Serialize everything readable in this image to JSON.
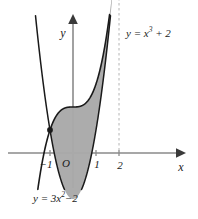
{
  "figure": {
    "background_color": "#ffffff",
    "shade_color": "#a9a9a9",
    "curve_color": "#1a1a1a",
    "axis_color": "#808080",
    "dash_color": "#b4b4b4"
  },
  "axes": {
    "x_label": "x",
    "y_label": "y",
    "origin_label": "O",
    "x_ticks": [
      {
        "label": "−1",
        "value": -1
      },
      {
        "label": "1",
        "value": 1
      },
      {
        "label": "2",
        "value": 2
      }
    ],
    "x_range": [
      -2.85,
      4.75
    ],
    "y_range": [
      -2.6,
      6.0
    ],
    "origin_px": {
      "x": 73,
      "y": 153
    },
    "unit_px": 23,
    "grid": "off"
  },
  "curves": {
    "cubic": {
      "label_prefix": "y = x",
      "label_exponent": "3",
      "label_suffix": "+ 2",
      "equation_plain": "y = x³ + 2",
      "expression": "x^3 + 2",
      "y_intercept": 2
    },
    "parabola": {
      "label_prefix": "y = 3x",
      "label_exponent": "2",
      "label_suffix": "−2",
      "equation_plain": "y = 3x² − 2",
      "expression": "3x^2 - 2",
      "vertex": {
        "x": 0,
        "y": -2
      }
    }
  },
  "intersections": [
    {
      "x": -1,
      "y": 1,
      "px": {
        "x": 50,
        "y": 130
      }
    },
    {
      "x": 2,
      "y": 10,
      "px": {
        "x": 119,
        "y": 33
      }
    }
  ],
  "dashed_guide": {
    "at_x": 2,
    "from_y": 10,
    "to_y": 0
  },
  "chart_data": {
    "type": "line",
    "title": "",
    "xlabel": "x",
    "ylabel": "y",
    "xlim": [
      -2.85,
      4.75
    ],
    "ylim": [
      -2.6,
      6.0
    ],
    "grid": false,
    "legend_position": "inline-curve-labels",
    "shaded_region": {
      "between": [
        "y = x³ + 2",
        "y = 3x² − 2"
      ],
      "x_from": -1,
      "x_to": 2,
      "fill": "#a9a9a9"
    },
    "series": [
      {
        "name": "y = x³ + 2",
        "expression": "x^3 + 2",
        "x": [
          -1.0,
          -0.75,
          -0.5,
          -0.25,
          0.0,
          0.25,
          0.5,
          0.75,
          1.0,
          1.25,
          1.5,
          1.75,
          2.0
        ],
        "values": [
          1.0,
          1.578,
          1.875,
          1.984,
          2.0,
          2.016,
          2.125,
          2.422,
          3.0,
          3.953,
          5.375,
          7.359,
          10.0
        ]
      },
      {
        "name": "y = 3x² − 2",
        "expression": "3x^2 - 2",
        "x": [
          -1.5,
          -1.25,
          -1.0,
          -0.75,
          -0.5,
          -0.25,
          0.0,
          0.25,
          0.5,
          0.75,
          1.0,
          1.25,
          1.5,
          1.75,
          2.0
        ],
        "values": [
          4.75,
          2.6875,
          1.0,
          -0.3125,
          -1.25,
          -1.8125,
          -2.0,
          -1.8125,
          -1.25,
          -0.3125,
          1.0,
          2.6875,
          4.75,
          7.1875,
          10.0
        ]
      }
    ],
    "points": [
      {
        "x": -1,
        "y": 1,
        "marker": "filled-dot"
      },
      {
        "x": 2,
        "y": 10,
        "marker": "filled-dot"
      }
    ]
  }
}
